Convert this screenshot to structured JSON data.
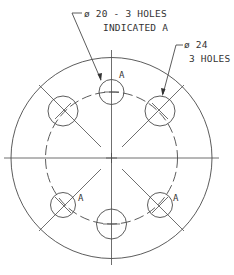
{
  "drawing": {
    "type": "flange bolt-hole pattern",
    "callouts": {
      "small_holes": {
        "line1": "ø 20 - 3 HOLES",
        "line2": "INDICATED A"
      },
      "large_holes": {
        "line1": "ø 24",
        "line2": "3 HOLES"
      }
    },
    "hole_marker": "A",
    "hole_markers": [
      "A",
      "A",
      "A"
    ],
    "colors": {
      "line": "#4a4a4a",
      "text": "#333333",
      "background": "#ffffff"
    }
  }
}
